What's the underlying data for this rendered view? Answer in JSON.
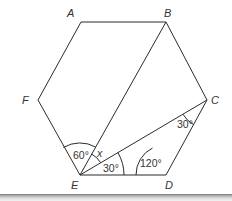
{
  "diagram": {
    "type": "regular hexagon with diagonals",
    "vertices": [
      {
        "id": "A",
        "label": "A",
        "x": 81,
        "y": 22
      },
      {
        "id": "B",
        "label": "B",
        "x": 166,
        "y": 22
      },
      {
        "id": "C",
        "label": "C",
        "x": 207,
        "y": 100
      },
      {
        "id": "D",
        "label": "D",
        "x": 166,
        "y": 175
      },
      {
        "id": "E",
        "label": "E",
        "x": 80,
        "y": 175
      },
      {
        "id": "F",
        "label": "F",
        "x": 38,
        "y": 100
      }
    ],
    "segments": [
      "AB",
      "BC",
      "CD",
      "DE",
      "EF",
      "FA",
      "EB",
      "EC"
    ],
    "angles": [
      {
        "vertex": "E",
        "between": "EF-EB",
        "label": "60°"
      },
      {
        "vertex": "E",
        "between": "EB-EC",
        "label": "x"
      },
      {
        "vertex": "E",
        "between": "EC-ED",
        "label": "30°"
      },
      {
        "vertex": "D",
        "between": "DE-DC",
        "label": "120°"
      },
      {
        "vertex": "C",
        "between": "CE-CD",
        "label": "30°"
      }
    ],
    "stroke_color": "#2b2b2b",
    "text_color": "#333333"
  }
}
